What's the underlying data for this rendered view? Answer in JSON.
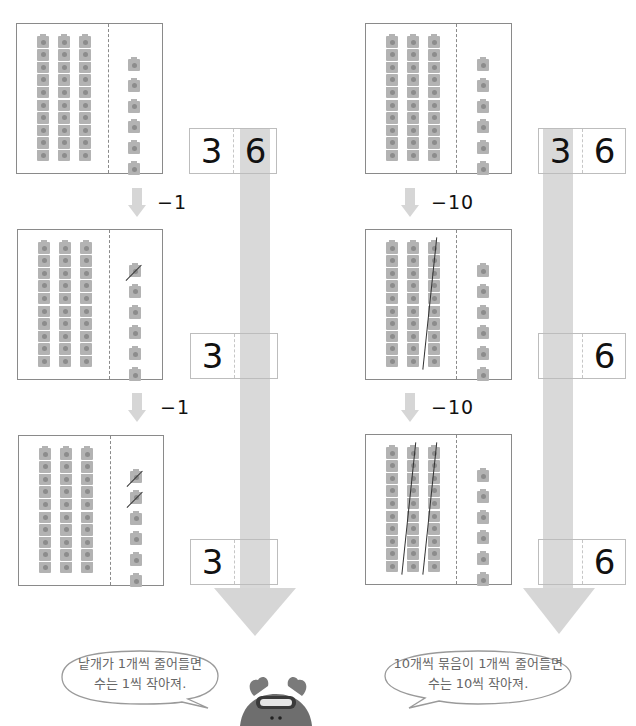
{
  "colors": {
    "cube_fill": "#b3b3b3",
    "cube_dot": "#8c8c8c",
    "frame_border": "#8a8a8a",
    "arrow_fill": "#d6d6d6",
    "text": "#111111",
    "bubble_text": "#666666",
    "mascot_body": "#6e6e6e"
  },
  "left_column": {
    "title": "Ones decrease",
    "frames": [
      {
        "tens_rods": 3,
        "ones_cubes": 6,
        "crossed_ones": 0,
        "crossed_rods": 0
      },
      {
        "tens_rods": 3,
        "ones_cubes": 6,
        "crossed_ones": 1,
        "crossed_rods": 0
      },
      {
        "tens_rods": 3,
        "ones_cubes": 6,
        "crossed_ones": 2,
        "crossed_rods": 0
      }
    ],
    "steps": [
      "−1",
      "−1"
    ],
    "place_values": [
      {
        "tens": "3",
        "ones": "6"
      },
      {
        "tens": "3",
        "ones": ""
      },
      {
        "tens": "3",
        "ones": ""
      }
    ],
    "bubble": {
      "line1": "낱개가 1개씩 줄어들면",
      "line2": "수는 1씩 작아져."
    }
  },
  "right_column": {
    "title": "Tens decrease",
    "frames": [
      {
        "tens_rods": 3,
        "ones_cubes": 6,
        "crossed_ones": 0,
        "crossed_rods": 0
      },
      {
        "tens_rods": 3,
        "ones_cubes": 6,
        "crossed_ones": 0,
        "crossed_rods": 1
      },
      {
        "tens_rods": 3,
        "ones_cubes": 6,
        "crossed_ones": 0,
        "crossed_rods": 2
      }
    ],
    "steps": [
      "−10",
      "−10"
    ],
    "place_values": [
      {
        "tens": "3",
        "ones": "6"
      },
      {
        "tens": "",
        "ones": "6"
      },
      {
        "tens": "",
        "ones": "6"
      }
    ],
    "bubble": {
      "line1": "10개씩 묶음이 1개씩 줄어들면",
      "line2": "수는 10씩 작아져."
    }
  },
  "mascot": {
    "icon": "dog-with-goggles-icon"
  }
}
